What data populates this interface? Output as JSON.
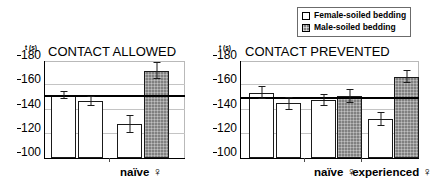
{
  "legend": {
    "position": "top-right",
    "entries": [
      {
        "label": "Female-soiled bedding",
        "swatch": "white",
        "color": "#ffffff"
      },
      {
        "label": "Male-soiled bedding",
        "swatch": "gray",
        "color": "#808080"
      }
    ]
  },
  "panels": [
    {
      "id": "contact-allowed",
      "title": "CONTACT ALLOWED",
      "y_unit": "t (s)",
      "yticks": [
        "180",
        "160",
        "140",
        "120",
        "100"
      ],
      "group_labels": [
        {
          "text": "naïve",
          "symbol": "♀"
        }
      ]
    },
    {
      "id": "contact-prevented",
      "title": "CONTACT PREVENTED",
      "y_unit": "t (s)",
      "yticks": [
        "180",
        "160",
        "140",
        "120",
        "100"
      ],
      "group_labels": [
        {
          "text": "naïve",
          "symbol": "♀"
        },
        {
          "text": "experienced",
          "symbol": "♀"
        }
      ]
    }
  ],
  "chart_data": [
    {
      "type": "bar",
      "title": "CONTACT ALLOWED",
      "xlabel": "",
      "ylabel": "t (s)",
      "ylim": [
        100,
        180
      ],
      "yticks": [
        100,
        120,
        140,
        160,
        180
      ],
      "grid": true,
      "reference_line": 150,
      "legend_position": "top-right",
      "categories": [
        "",
        "",
        "naïve ♀",
        "naïve ♀"
      ],
      "bars": [
        {
          "group": "",
          "series": "Female-soiled bedding",
          "value": 152,
          "error": 3.5,
          "fill": "white"
        },
        {
          "group": "",
          "series": "Female-soiled bedding",
          "value": 147,
          "error": 4.0,
          "fill": "white"
        },
        {
          "group": "naïve ♀",
          "series": "Female-soiled bedding",
          "value": 128,
          "error": 7.5,
          "fill": "white"
        },
        {
          "group": "naïve ♀",
          "series": "Male-soiled bedding",
          "value": 172,
          "error": 7.0,
          "fill": "gray"
        }
      ]
    },
    {
      "type": "bar",
      "title": "CONTACT PREVENTED",
      "xlabel": "",
      "ylabel": "t (s)",
      "ylim": [
        100,
        180
      ],
      "yticks": [
        100,
        120,
        140,
        160,
        180
      ],
      "grid": true,
      "reference_line": 149,
      "legend_position": "top-right",
      "categories": [
        "",
        "",
        "naïve ♀",
        "naïve ♀",
        "experienced ♀",
        "experienced ♀"
      ],
      "bars": [
        {
          "group": "",
          "series": "Female-soiled bedding",
          "value": 154,
          "error": 5.0,
          "fill": "white"
        },
        {
          "group": "",
          "series": "Female-soiled bedding",
          "value": 145,
          "error": 5.0,
          "fill": "white"
        },
        {
          "group": "naïve ♀",
          "series": "Female-soiled bedding",
          "value": 148,
          "error": 5.0,
          "fill": "white"
        },
        {
          "group": "naïve ♀",
          "series": "Male-soiled bedding",
          "value": 151,
          "error": 6.0,
          "fill": "gray"
        },
        {
          "group": "experienced ♀",
          "series": "Female-soiled bedding",
          "value": 132,
          "error": 6.0,
          "fill": "white"
        },
        {
          "group": "experienced ♀",
          "series": "Male-soiled bedding",
          "value": 167,
          "error": 5.5,
          "fill": "gray"
        }
      ]
    }
  ]
}
